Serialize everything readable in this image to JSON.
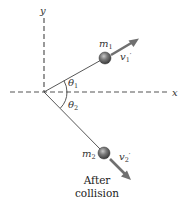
{
  "diagram": {
    "axes": {
      "x_label": "x",
      "y_label": "y"
    },
    "particles": [
      {
        "mass_label_base": "m",
        "mass_label_sub": "1",
        "velocity_label_base": "v",
        "velocity_label_sub": "1",
        "velocity_label_prime": "′",
        "angle_label_base": "θ",
        "angle_label_sub": "1",
        "direction": "up-right"
      },
      {
        "mass_label_base": "m",
        "mass_label_sub": "2",
        "velocity_label_base": "v",
        "velocity_label_sub": "2",
        "velocity_label_prime": "′",
        "angle_label_base": "θ",
        "angle_label_sub": "2",
        "direction": "down-right"
      }
    ],
    "caption_line1": "After",
    "caption_line2": "collision",
    "colors": {
      "axis": "#555555",
      "line": "#444444",
      "arrow": "#707070",
      "ball": "#6a6a6a",
      "ball_highlight": "#b0b0b0",
      "text": "#333333"
    }
  }
}
